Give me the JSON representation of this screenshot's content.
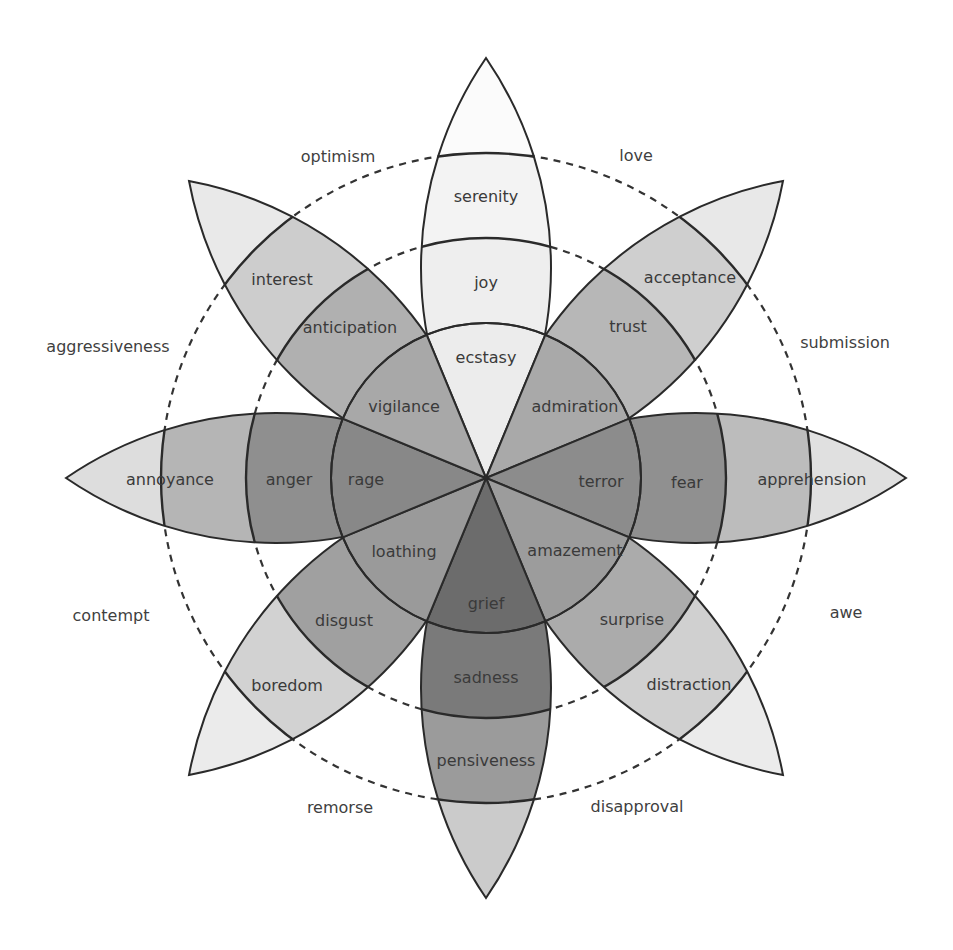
{
  "diagram": {
    "center": [
      486,
      478
    ],
    "radii": {
      "inner_circle": 155,
      "middle_dashed": 240,
      "outer_dashed": 325,
      "petal_tip": 420
    },
    "petals": [
      {
        "angle": -90,
        "primary": "joy",
        "intense": "ecstasy",
        "mild": "serenity",
        "colors": [
          "#ececec",
          "#eeeeee",
          "#f3f3f3",
          "#fbfbfb"
        ]
      },
      {
        "angle": -45,
        "primary": "trust",
        "intense": "admiration",
        "mild": "acceptance",
        "colors": [
          "#a9a9a9",
          "#b7b7b7",
          "#cfcfcf",
          "#e8e8e8"
        ]
      },
      {
        "angle": 0,
        "primary": "fear",
        "intense": "terror",
        "mild": "apprehension",
        "colors": [
          "#8c8c8c",
          "#909090",
          "#bcbcbc",
          "#e0e0e0"
        ]
      },
      {
        "angle": 45,
        "primary": "surprise",
        "intense": "amazement",
        "mild": "distraction",
        "colors": [
          "#9c9c9c",
          "#ababab",
          "#d0d0d0",
          "#ebebeb"
        ]
      },
      {
        "angle": 90,
        "primary": "sadness",
        "intense": "grief",
        "mild": "pensiveness",
        "colors": [
          "#6c6c6c",
          "#7a7a7a",
          "#9b9b9b",
          "#cbcbcb"
        ]
      },
      {
        "angle": 135,
        "primary": "disgust",
        "intense": "loathing",
        "mild": "boredom",
        "colors": [
          "#9a9a9a",
          "#a0a0a0",
          "#d2d2d2",
          "#ebebeb"
        ]
      },
      {
        "angle": 180,
        "primary": "anger",
        "intense": "rage",
        "mild": "annoyance",
        "colors": [
          "#888888",
          "#8f8f8f",
          "#b5b5b5",
          "#dddddd"
        ]
      },
      {
        "angle": -135,
        "primary": "anticipation",
        "intense": "vigilance",
        "mild": "interest",
        "colors": [
          "#a8a8a8",
          "#b0b0b0",
          "#cdcdcd",
          "#e9e9e9"
        ]
      }
    ],
    "dyads": [
      {
        "label": "optimism",
        "x": 338,
        "y": 162
      },
      {
        "label": "love",
        "x": 636,
        "y": 161
      },
      {
        "label": "submission",
        "x": 845,
        "y": 348
      },
      {
        "label": "awe",
        "x": 846,
        "y": 618
      },
      {
        "label": "disapproval",
        "x": 637,
        "y": 812
      },
      {
        "label": "remorse",
        "x": 340,
        "y": 813
      },
      {
        "label": "contempt",
        "x": 111,
        "y": 621
      },
      {
        "label": "aggressiveness",
        "x": 108,
        "y": 352
      }
    ],
    "label_positions": {
      "ecstasy": [
        486,
        363
      ],
      "admiration": [
        575,
        412
      ],
      "terror": [
        601,
        487
      ],
      "amazement": [
        575,
        556
      ],
      "grief": [
        486,
        609
      ],
      "loathing": [
        404,
        557
      ],
      "rage": [
        366,
        485
      ],
      "vigilance": [
        404,
        412
      ],
      "joy": [
        486,
        288
      ],
      "trust": [
        628,
        332
      ],
      "fear": [
        687,
        488
      ],
      "surprise": [
        632,
        625
      ],
      "sadness": [
        486,
        683
      ],
      "disgust": [
        344,
        626
      ],
      "anger": [
        289,
        485
      ],
      "anticipation": [
        350,
        333
      ],
      "serenity": [
        486,
        202
      ],
      "acceptance": [
        690,
        283
      ],
      "apprehension": [
        812,
        485
      ],
      "distraction": [
        689,
        690
      ],
      "pensiveness": [
        486,
        766
      ],
      "boredom": [
        287,
        691
      ],
      "annoyance": [
        170,
        485
      ],
      "interest": [
        282,
        285
      ]
    }
  }
}
